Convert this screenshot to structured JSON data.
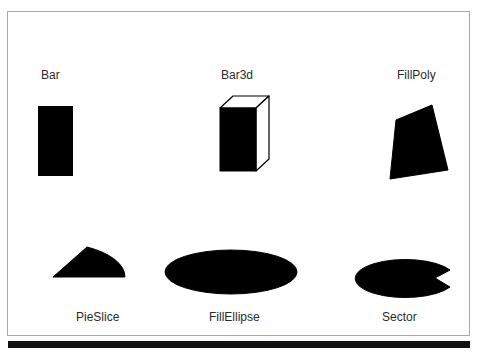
{
  "window": {
    "background_color": "#ffffff",
    "frame_color": "#a8a8a8",
    "footer_bar_color": "#111111"
  },
  "shapes": [
    {
      "id": "bar",
      "label": "Bar",
      "kind": "rectangle",
      "fill_color": "#000000",
      "stroke_color": "#000000",
      "x": 30,
      "y": 94,
      "width": 34,
      "height": 69,
      "label_x": 33,
      "label_y": 56
    },
    {
      "id": "bar3d",
      "label": "Bar3d",
      "kind": "bar3d-box",
      "fill_color": "#000000",
      "stroke_color": "#000000",
      "top_face_color": "#ffffff",
      "side_face_color": "#ffffff",
      "x": 210,
      "y": 82,
      "width": 52,
      "height": 80,
      "depth": 13,
      "label_x": 213,
      "label_y": 56
    },
    {
      "id": "fillpoly",
      "label": "FillPoly",
      "kind": "polygon",
      "fill_color": "#000000",
      "stroke_color": "#000000",
      "points": "10,20 46,5 62,70 4,79",
      "x": 378,
      "y": 88,
      "width": 68,
      "height": 86,
      "label_x": 389,
      "label_y": 56
    },
    {
      "id": "pieslice",
      "label": "PieSlice",
      "kind": "pie-slice",
      "fill_color": "#000000",
      "stroke_color": "#000000",
      "center_x": 3,
      "center_y": 33,
      "radius_x": 72,
      "radius_y": 34,
      "start_angle_deg": 0,
      "end_angle_deg": 62,
      "x": 42,
      "y": 232,
      "width": 80,
      "height": 40,
      "label_x": 68,
      "label_y": 298
    },
    {
      "id": "fillellipse",
      "label": "FillEllipse",
      "kind": "ellipse",
      "fill_color": "#000000",
      "stroke_color": "#000000",
      "center_x": 67,
      "center_y": 24,
      "radius_x": 66,
      "radius_y": 22,
      "x": 156,
      "y": 236,
      "width": 136,
      "height": 50,
      "label_x": 201,
      "label_y": 298
    },
    {
      "id": "sector",
      "label": "Sector",
      "kind": "elliptical-sector",
      "fill_color": "#000000",
      "stroke_color": "#000000",
      "center_x": 87,
      "center_y": 20,
      "radius_x": 50,
      "radius_y": 19,
      "start_angle_deg": 25,
      "end_angle_deg": 335,
      "x": 340,
      "y": 246,
      "width": 104,
      "height": 42,
      "label_x": 374,
      "label_y": 298
    }
  ]
}
